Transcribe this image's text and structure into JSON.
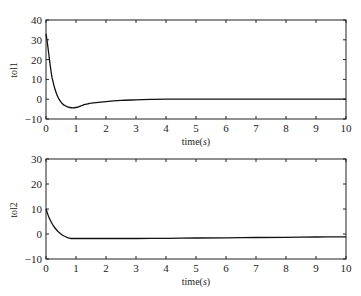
{
  "chart_data": [
    {
      "type": "line",
      "title": "",
      "xlabel": "time(s)",
      "ylabel": "tol1",
      "xlim": [
        0,
        10
      ],
      "ylim": [
        -10,
        40
      ],
      "xticks": [
        0,
        1,
        2,
        3,
        4,
        5,
        6,
        7,
        8,
        9,
        10
      ],
      "yticks": [
        -10,
        0,
        10,
        20,
        30,
        40
      ],
      "grid": false,
      "series": [
        {
          "name": "tol1",
          "x": [
            0,
            0.05,
            0.1,
            0.15,
            0.2,
            0.3,
            0.4,
            0.5,
            0.6,
            0.7,
            0.8,
            0.9,
            1.0,
            1.1,
            1.2,
            1.3,
            1.4,
            1.5,
            2.0,
            2.5,
            3.0,
            3.5,
            4.0,
            5,
            6,
            7,
            8,
            9,
            10
          ],
          "values": [
            33,
            28,
            22,
            16,
            11,
            5,
            1,
            -1.5,
            -3,
            -3.8,
            -4.2,
            -4.4,
            -4.2,
            -3.8,
            -3.2,
            -2.6,
            -2.3,
            -2.0,
            -1.2,
            -0.6,
            -0.3,
            -0.1,
            0,
            0,
            0,
            0,
            0,
            0,
            0
          ]
        }
      ]
    },
    {
      "type": "line",
      "title": "",
      "xlabel": "time(s)",
      "ylabel": "tol2",
      "xlim": [
        0,
        10
      ],
      "ylim": [
        -10,
        30
      ],
      "xticks": [
        0,
        1,
        2,
        3,
        4,
        5,
        6,
        7,
        8,
        9,
        10
      ],
      "yticks": [
        -10,
        0,
        10,
        20,
        30
      ],
      "grid": false,
      "series": [
        {
          "name": "tol2",
          "x": [
            0,
            0.05,
            0.1,
            0.2,
            0.3,
            0.4,
            0.5,
            0.6,
            0.7,
            0.8,
            0.9,
            1.0,
            2,
            3,
            4,
            5,
            6,
            7,
            8,
            9,
            10
          ],
          "values": [
            10,
            8.2,
            6.6,
            4.2,
            2.4,
            1.0,
            0,
            -0.8,
            -1.3,
            -1.7,
            -1.8,
            -1.8,
            -1.8,
            -1.8,
            -1.7,
            -1.6,
            -1.5,
            -1.4,
            -1.3,
            -1.2,
            -1.1
          ]
        }
      ]
    }
  ],
  "plots": [
    {
      "ylabel": "tol1",
      "xlabel_prefix": "time(",
      "xlabel_unit": "s",
      "xlabel_suffix": ")",
      "xtick_labels": [
        "0",
        "1",
        "2",
        "3",
        "4",
        "5",
        "6",
        "7",
        "8",
        "9",
        "10"
      ],
      "ytick_labels": [
        "40",
        "30",
        "20",
        "10",
        "0",
        "−10"
      ]
    },
    {
      "ylabel": "tol2",
      "xlabel_prefix": "time(",
      "xlabel_unit": "s",
      "xlabel_suffix": ")",
      "xtick_labels": [
        "0",
        "1",
        "2",
        "3",
        "4",
        "5",
        "6",
        "7",
        "8",
        "9",
        "10"
      ],
      "ytick_labels": [
        "30",
        "20",
        "10",
        "0",
        "−10"
      ]
    }
  ]
}
